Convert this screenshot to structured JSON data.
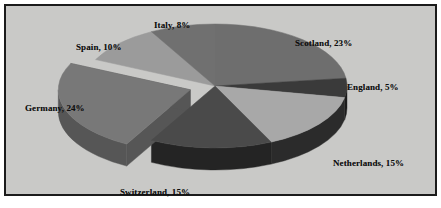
{
  "figure": {
    "background_color": "#c9c9c7",
    "border_color": "#1b1b1b",
    "label_color": "#0d0d0d"
  },
  "chart_data": {
    "type": "pie",
    "title": "",
    "subtitle": "",
    "xlabel": "",
    "ylabel": "",
    "legend_position": "none",
    "grid": false,
    "three_d": true,
    "start_angle_deg": 0,
    "direction": "clockwise",
    "labels_show_percent": true,
    "categories": [
      "Scotland",
      "England",
      "Netherlands",
      "Switzerland",
      "Germany",
      "Spain",
      "Italy"
    ],
    "values": [
      23,
      5,
      15,
      15,
      24,
      10,
      8
    ],
    "units": "%",
    "total": 100,
    "exploded": [
      "Germany"
    ],
    "slice_colors": [
      "#6e6e6e",
      "#3a3a3a",
      "#a8a8a8",
      "#4a4a4a",
      "#787878",
      "#9b9b9b",
      "#707070"
    ],
    "slice_side_colors": [
      "#4d4d4d",
      "#1c1c1c",
      "#2b2b2b",
      "#242424",
      "#565656",
      "#6d6d6d",
      "#4f4f4f"
    ],
    "annotations": [
      "Scotland, 23%",
      "England, 5%",
      "Netherlands, 15%",
      "Switzerland, 15%",
      "Germany, 24%",
      "Spain, 10%",
      "Italy, 8%"
    ],
    "slices": [
      {
        "name": "Scotland",
        "value": 23,
        "label": "Scotland, 23%",
        "color": "#6e6e6e",
        "side_color": "#4d4d4d"
      },
      {
        "name": "England",
        "value": 5,
        "label": "England, 5%",
        "color": "#3a3a3a",
        "side_color": "#1c1c1c"
      },
      {
        "name": "Netherlands",
        "value": 15,
        "label": "Netherlands, 15%",
        "color": "#a8a8a8",
        "side_color": "#2b2b2b"
      },
      {
        "name": "Switzerland",
        "value": 15,
        "label": "Switzerland, 15%",
        "color": "#4a4a4a",
        "side_color": "#242424"
      },
      {
        "name": "Germany",
        "value": 24,
        "label": "Germany, 24%",
        "color": "#787878",
        "side_color": "#565656"
      },
      {
        "name": "Spain",
        "value": 10,
        "label": "Spain, 10%",
        "color": "#9b9b9b",
        "side_color": "#6d6d6d"
      },
      {
        "name": "Italy",
        "value": 8,
        "label": "Italy, 8%",
        "color": "#707070",
        "side_color": "#4f4f4f"
      }
    ]
  }
}
